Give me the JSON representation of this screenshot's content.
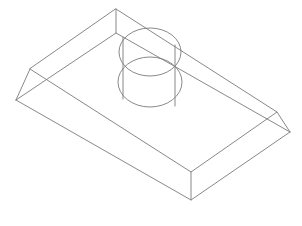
{
  "drawing": {
    "type": "isometric-wireframe",
    "subject": "rectangular block with chamfered top edges and cylindrical boss",
    "stroke_color": "#7a7a7a",
    "background_color": "#ffffff",
    "base_block": {
      "top_face": [
        [
          116,
          9
        ],
        [
          277,
          112
        ],
        [
          191,
          172
        ],
        [
          30,
          69
        ]
      ],
      "bottom_face": [
        [
          116,
          33
        ],
        [
          290,
          132
        ],
        [
          191,
          200
        ],
        [
          16,
          100
        ]
      ]
    },
    "cylinder": {
      "top_ellipse": {
        "cx": 150,
        "cy": 52,
        "rx": 31,
        "ry": 24
      },
      "bottom_ellipse": {
        "cx": 150,
        "cy": 82,
        "rx": 32,
        "ry": 25
      },
      "silhouette_left": [
        [
          122,
          35
        ],
        [
          122,
          98
        ]
      ],
      "silhouette_right": [
        [
          176,
          45
        ],
        [
          176,
          108
        ]
      ]
    }
  }
}
